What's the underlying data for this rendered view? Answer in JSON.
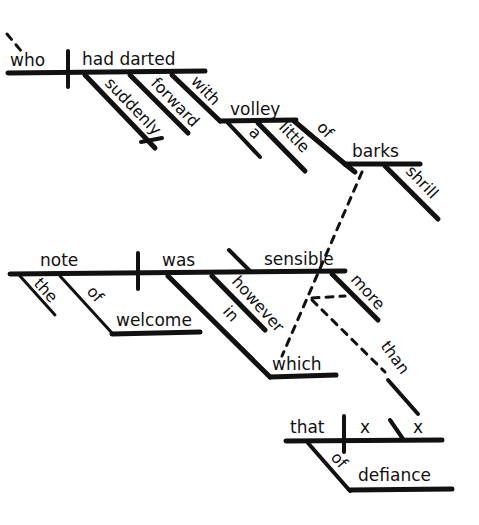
{
  "diagram": {
    "type": "Reed-Kellogg sentence diagram",
    "clause1": {
      "subject": "who",
      "verb": "had darted",
      "modifiers": [
        "suddenly",
        "forward",
        "with"
      ],
      "object_of_with": "volley",
      "volley_modifiers": [
        "a",
        "little",
        "of"
      ],
      "object_of_of": "barks",
      "barks_modifier": "shrill"
    },
    "clause2": {
      "subject": "note",
      "verb": "was",
      "complement": "sensible",
      "subject_modifiers": [
        "the",
        "of"
      ],
      "object_of_of": "welcome",
      "verb_modifiers": [
        "however",
        "in"
      ],
      "object_of_in": "which",
      "complement_modifier": "more",
      "connector": "than"
    },
    "clause3": {
      "subject": "that",
      "verb": "x",
      "complement": "x",
      "modifier": "of",
      "object_of_of": "defiance"
    }
  }
}
